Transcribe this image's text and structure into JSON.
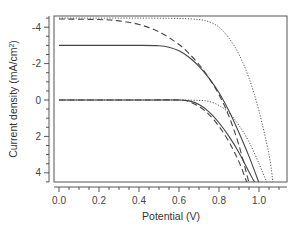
{
  "chart_data": {
    "type": "line",
    "title": "",
    "xlabel": "Potential (V)",
    "ylabel": "Current density (mA/cm²)",
    "ylabel_parts": {
      "main": "Current density (mA/cm",
      "sup": "2",
      "close": ")"
    },
    "xlim": [
      -0.02,
      1.14
    ],
    "ylim": [
      4.55,
      -4.6
    ],
    "y_inverted": true,
    "grid": false,
    "legend": null,
    "xticks": [
      {
        "value": 0.0,
        "label": "0.0"
      },
      {
        "value": 0.2,
        "label": "0.2"
      },
      {
        "value": 0.4,
        "label": "0.4"
      },
      {
        "value": 0.6,
        "label": "0.6"
      },
      {
        "value": 0.8,
        "label": "0.8"
      },
      {
        "value": 1.0,
        "label": "1.0"
      }
    ],
    "yticks": [
      {
        "value": -4,
        "label": "-4"
      },
      {
        "value": -2,
        "label": "-2"
      },
      {
        "value": 0,
        "label": "0"
      },
      {
        "value": 2,
        "label": "2"
      },
      {
        "value": 4,
        "label": "4"
      }
    ],
    "series": [
      {
        "name": "dotted-illuminated",
        "style": "dotted",
        "x": [
          0.0,
          0.2,
          0.4,
          0.6,
          0.7,
          0.75,
          0.8,
          0.85,
          0.9,
          0.95,
          1.0,
          1.05,
          1.07
        ],
        "y": [
          -4.5,
          -4.5,
          -4.5,
          -4.48,
          -4.42,
          -4.3,
          -4.0,
          -3.4,
          -2.5,
          -1.2,
          0.6,
          3.0,
          4.55
        ]
      },
      {
        "name": "dashed-illuminated",
        "style": "dashed",
        "x": [
          0.0,
          0.2,
          0.3,
          0.4,
          0.5,
          0.6,
          0.65,
          0.7,
          0.75,
          0.8,
          0.85,
          0.9,
          0.95
        ],
        "y": [
          -4.45,
          -4.42,
          -4.35,
          -4.15,
          -3.75,
          -3.05,
          -2.55,
          -1.95,
          -1.2,
          -0.3,
          0.9,
          2.5,
          4.55
        ]
      },
      {
        "name": "solid-illuminated",
        "style": "solid",
        "x": [
          0.0,
          0.2,
          0.4,
          0.5,
          0.55,
          0.6,
          0.65,
          0.7,
          0.75,
          0.8,
          0.85,
          0.9,
          0.95,
          1.0
        ],
        "y": [
          -3.0,
          -3.0,
          -3.0,
          -2.98,
          -2.9,
          -2.7,
          -2.35,
          -1.85,
          -1.2,
          -0.4,
          0.6,
          1.8,
          3.1,
          4.55
        ]
      },
      {
        "name": "dotted-dark",
        "style": "dotted",
        "x": [
          0.0,
          0.4,
          0.6,
          0.7,
          0.75,
          0.8,
          0.85,
          0.9,
          0.95,
          1.0,
          1.04
        ],
        "y": [
          0.0,
          0.0,
          0.0,
          0.02,
          0.08,
          0.3,
          0.7,
          1.4,
          2.3,
          3.5,
          4.55
        ]
      },
      {
        "name": "solid-dark",
        "style": "solid",
        "x": [
          0.0,
          0.4,
          0.6,
          0.65,
          0.7,
          0.75,
          0.8,
          0.85,
          0.9,
          0.95,
          0.98
        ],
        "y": [
          0.0,
          0.0,
          0.0,
          0.05,
          0.25,
          0.65,
          1.25,
          2.0,
          2.9,
          3.95,
          4.55
        ]
      },
      {
        "name": "dashed-dark",
        "style": "dashed",
        "x": [
          0.0,
          0.4,
          0.6,
          0.65,
          0.7,
          0.75,
          0.8,
          0.85,
          0.9,
          0.94
        ],
        "y": [
          0.0,
          0.0,
          0.0,
          0.1,
          0.35,
          0.8,
          1.45,
          2.3,
          3.4,
          4.55
        ]
      }
    ]
  },
  "colors": {
    "axis": "#555555",
    "line": "#444444",
    "text": "#444444"
  }
}
